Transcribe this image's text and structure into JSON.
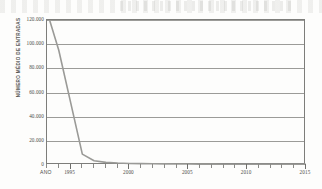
{
  "figure": {
    "background": "#fdfdfc",
    "frame_color": "#7d7d7a",
    "grid_color": "#9b9b98",
    "line_color": "#9a9a97",
    "text_color": "#4a4a48"
  },
  "axis": {
    "x_title": "ANO",
    "y_title": "NÚMERO MÉDIO DE ENTRADAS"
  },
  "chart_data": {
    "type": "line",
    "title": "",
    "xlabel": "ANO",
    "ylabel": "NÚMERO MÉDIO DE ENTRADAS",
    "xlim": [
      1993,
      2015
    ],
    "ylim": [
      0,
      120000
    ],
    "grid": true,
    "legend": "none",
    "y_ticks": [
      0,
      20000,
      40000,
      60000,
      80000,
      100000,
      120000
    ],
    "y_tick_labels": [
      "0",
      "20.000",
      "40.000",
      "60.000",
      "80.000",
      "100.000",
      "120.000"
    ],
    "x_ticks": [
      1995,
      2000,
      2005,
      2010,
      2015
    ],
    "x_tick_labels": [
      "1995",
      "2000",
      "2005",
      "2010",
      "2015"
    ],
    "x_minor_step": 1,
    "series": [
      {
        "name": "Número médio de entradas",
        "x": [
          1993,
          1994,
          1995,
          1996,
          1997,
          1998,
          1999,
          2000,
          2001,
          2002,
          2003,
          2004,
          2005,
          2006,
          2007,
          2008,
          2009,
          2010,
          2011,
          2012,
          2013,
          2014,
          2015
        ],
        "values": [
          127000,
          95000,
          52000,
          9000,
          3500,
          2200,
          1600,
          1300,
          1100,
          1000,
          900,
          850,
          800,
          750,
          700,
          680,
          650,
          620,
          600,
          580,
          560,
          540,
          520
        ]
      }
    ]
  }
}
